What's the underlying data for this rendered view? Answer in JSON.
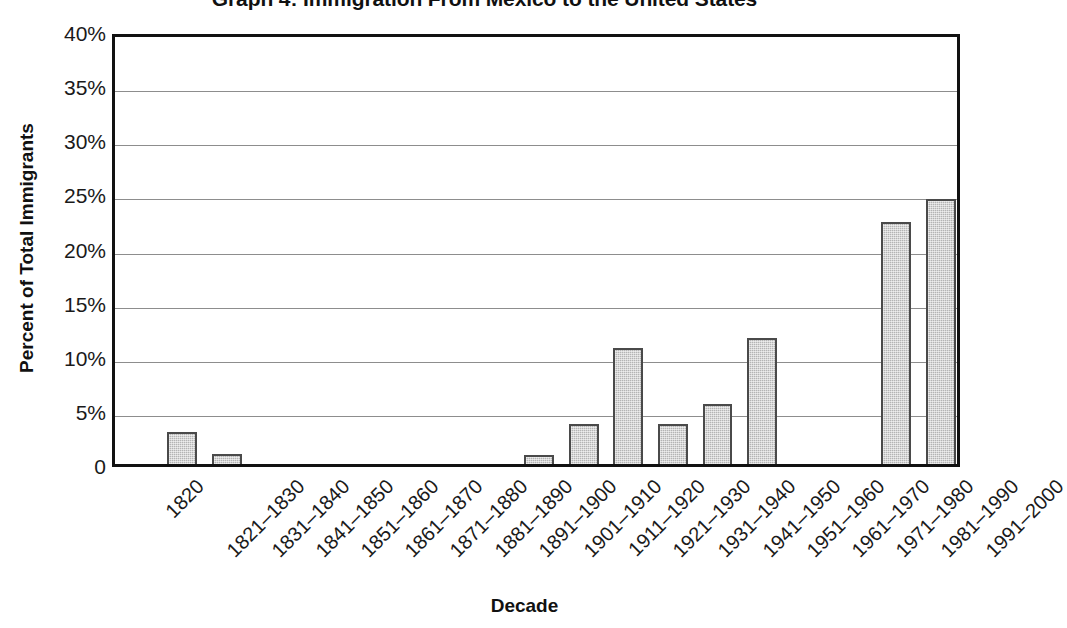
{
  "chart_data": {
    "type": "bar",
    "title": "Graph 4: Immigration From Mexico to the United States",
    "xlabel": "Decade",
    "ylabel": "Percent of Total Immigrants",
    "ylim": [
      0,
      40
    ],
    "ytick_labels": [
      "40%",
      "35%",
      "30%",
      "25%",
      "20%",
      "15%",
      "10%",
      "5%",
      "0"
    ],
    "ytick_values": [
      40,
      35,
      30,
      25,
      20,
      15,
      10,
      5,
      0
    ],
    "grid": true,
    "legend": "none",
    "bar_color": "#b4b4b4",
    "bar_edge_color": "#4a4a4a",
    "categories": [
      "1820",
      "1821–1830",
      "1831–1840",
      "1841–1850",
      "1851–1860",
      "1861–1870",
      "1871–1880",
      "1881–1890",
      "1891–1900",
      "1901–1910",
      "1911–1920",
      "1921–1930",
      "1931–1940",
      "1941–1950",
      "1951–1960",
      "1961–1970",
      "1971–1980",
      "1981–1990",
      "1991–2000"
    ],
    "values": [
      0,
      3.0,
      0.9,
      0,
      0,
      0,
      0,
      0,
      0,
      0.8,
      3.7,
      10.7,
      3.7,
      5.5,
      11.6,
      0,
      0,
      22.4,
      24.5
    ]
  }
}
